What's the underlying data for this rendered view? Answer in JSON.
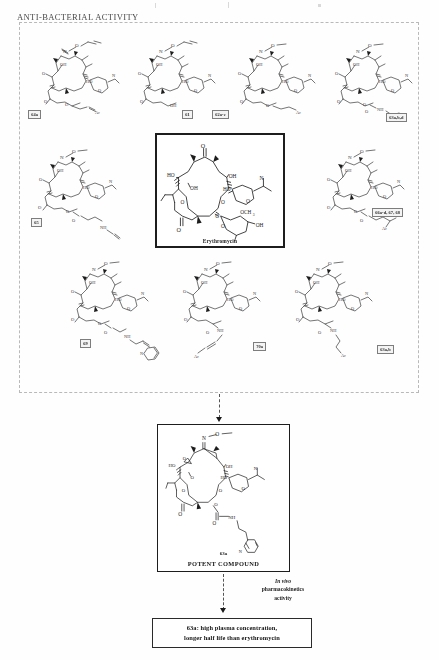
{
  "document": {
    "title": "ANTI-BACTERIAL ACTIVITY"
  },
  "scheme": {
    "panel_label": "anti-bacterial-activity-panel",
    "core": {
      "id": "erythromycin-core",
      "caption": "Erythromycin",
      "description": "14-membered macrolide core with desosamine and cladinose sugars, OCH3 and OH substituents"
    },
    "analogues": [
      {
        "label": "64a",
        "row": 1,
        "col": 1,
        "oxime": "O-allyl oxime",
        "side_chain": "propargyl ether, Ar"
      },
      {
        "label": "61",
        "row": 1,
        "col": 2,
        "oxime": "O-allyl oxime",
        "side_chain": "free OH"
      },
      {
        "label": "62a-c",
        "row": 1,
        "col": 3,
        "oxime": "O-methyl oxime",
        "side_chain": "alkyl ether, Ar"
      },
      {
        "label": "63a,b,d",
        "row": 1,
        "col": 4,
        "oxime": "O-methyl oxime",
        "side_chain": "carbamate NH-(CH2)3-Ar"
      },
      {
        "label": "65",
        "row": 2,
        "col": 1,
        "oxime": "O-methyl oxime",
        "side_chain": "ester linked propargylamine NH"
      },
      {
        "label": "66a-d, 67, 68",
        "row": 2,
        "col": 2,
        "oxime": "O-methyl oxime",
        "side_chain": "ester linked alkyl amine, Ar"
      },
      {
        "label": "69",
        "row": 3,
        "col": 1,
        "oxime": "O-methyl oxime",
        "side_chain": "allylic amine linked to pyridine"
      },
      {
        "label": "70a",
        "row": 3,
        "col": 2,
        "oxime": "O-methyl oxime",
        "side_chain": "carbamate NH-CH2-alkyne-Ar"
      },
      {
        "label": "63a,b",
        "row": 3,
        "col": 3,
        "oxime": "O-methyl oxime",
        "side_chain": "carbamate NH-(CH2)3-Ar"
      }
    ],
    "potent": {
      "id": "63a",
      "caption": "POTENT COMPOUND",
      "description": "O-methyl oxime erythromycin with 3-(pyridin-3-yl)propyl carbamate side chain"
    },
    "transition": {
      "line1": "In vivo",
      "line2": "pharmacokinetics",
      "line3": "activity"
    },
    "result": {
      "line1": "63a: high plasma concentration,",
      "line2": "longer half life than erythromycin"
    }
  },
  "colors": {
    "ink": "#1d1d1d",
    "dashed_border": "#b9b9b9",
    "label_fill": "#f4f4f4",
    "page": "#fefefe"
  }
}
